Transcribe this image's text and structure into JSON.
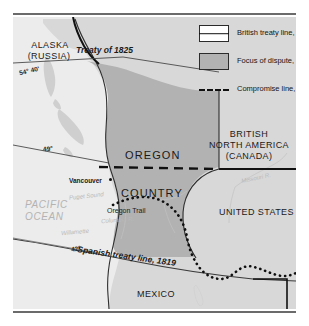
{
  "legend": {
    "items": [
      {
        "key": "british-treaty-line",
        "symbol": "solid-line-in-box",
        "label": "British treaty line, 1818"
      },
      {
        "key": "focus-of-dispute",
        "symbol": "gray-fill-box",
        "label": "Focus of dispute, 1846"
      },
      {
        "key": "compromise-line",
        "symbol": "dashed-line",
        "label": "Compromise line, 1846"
      }
    ]
  },
  "map": {
    "territories": [
      {
        "id": "alaska",
        "label": "ALASKA",
        "sub": "(RUSSIA)"
      },
      {
        "id": "oregon",
        "label": "OREGON"
      },
      {
        "id": "oregon-country",
        "label": "COUNTRY"
      },
      {
        "id": "bna",
        "line1": "BRITISH",
        "line2": "NORTH AMERICA",
        "line3": "(CANADA)"
      },
      {
        "id": "united-states",
        "label": "UNITED STATES"
      },
      {
        "id": "mexico",
        "label": "MEXICO"
      }
    ],
    "annotations": [
      {
        "id": "treaty-1825",
        "label": "Treaty of 1825"
      },
      {
        "id": "spanish-treaty-1819",
        "label": "Spanish treaty line, 1819"
      },
      {
        "id": "oregon-trail",
        "label": "Oregon Trail"
      }
    ],
    "latitudes": [
      {
        "id": "lat-5440",
        "label": "54° 40'"
      },
      {
        "id": "lat-49",
        "label": "49°"
      },
      {
        "id": "lat-42",
        "label": "42°"
      }
    ],
    "cities": [
      {
        "id": "vancouver",
        "label": "Vancouver"
      }
    ],
    "water": [
      {
        "id": "pacific-ocean",
        "line1": "PACIFIC",
        "line2": "OCEAN"
      },
      {
        "id": "puget-sound",
        "label": "Puget Sound"
      },
      {
        "id": "columbia-river",
        "label": "Columbia R."
      },
      {
        "id": "willamette",
        "label": "Willamette"
      },
      {
        "id": "missouri-river",
        "label": "Missouri R."
      }
    ]
  },
  "colors": {
    "dispute_fill": "#b2b2b2",
    "land_fill": "#d8d8d8",
    "ocean_fill": "#ececec",
    "border_line": "#1a1a1a",
    "rule": "#6b6b6b"
  }
}
